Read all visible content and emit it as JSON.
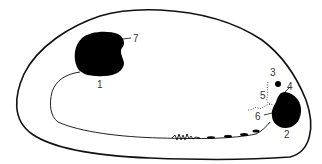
{
  "diagram": {
    "labels": {
      "l1": "1",
      "l2": "2",
      "l3": "3",
      "l4": "4",
      "l5": "5",
      "l6": "6",
      "l7": "7"
    },
    "colors": {
      "stroke": "#111111",
      "fill": "#000000",
      "background": "#ffffff"
    }
  }
}
